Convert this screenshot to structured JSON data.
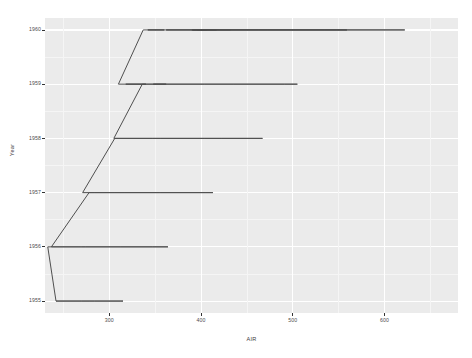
{
  "chart_data": {
    "type": "line",
    "title": "",
    "subtitle": "",
    "xlabel": "AIR",
    "ylabel": "Year",
    "xlim": [
      230,
      680
    ],
    "ylim": [
      1954.78,
      1960.22
    ],
    "grid": true,
    "legend": null,
    "x_ticks": [
      300,
      400,
      500,
      600
    ],
    "x_tick_labels": [
      "300",
      "400",
      "500",
      "600"
    ],
    "y_ticks": [
      1955,
      1956,
      1957,
      1958,
      1959,
      1960
    ],
    "y_tick_labels": [
      "1955",
      "1956",
      "1957",
      "1958",
      "1959",
      "1960"
    ],
    "series": [
      {
        "name": "AirPassengers",
        "color": "#4f4f4f",
        "x": [
          242,
          284,
          315,
          312,
          278,
          270,
          242,
          233,
          267,
          269,
          270,
          315,
          364,
          347,
          312,
          274,
          237,
          278,
          284,
          317,
          356,
          413,
          405,
          355,
          306,
          271,
          306,
          315,
          356,
          422,
          465,
          467,
          404,
          347,
          305,
          336,
          340,
          318,
          362,
          348,
          363,
          435,
          491,
          505,
          404,
          359,
          310,
          337,
          360,
          342,
          406,
          396,
          420,
          472,
          548,
          559,
          463,
          407,
          362,
          405,
          417,
          391,
          419,
          461,
          472,
          535,
          622,
          606,
          508,
          461,
          390,
          432
        ],
        "y": [
          1955.0,
          1955.0,
          1955.0,
          1955.0,
          1955.0,
          1955.0,
          1955.0,
          1956.0,
          1956.0,
          1956.0,
          1956.0,
          1956.0,
          1956.0,
          1956.0,
          1956.0,
          1956.0,
          1956.0,
          1957.0,
          1957.0,
          1957.0,
          1957.0,
          1957.0,
          1957.0,
          1957.0,
          1957.0,
          1957.0,
          1958.0,
          1958.0,
          1958.0,
          1958.0,
          1958.0,
          1958.0,
          1958.0,
          1958.0,
          1958.0,
          1959.0,
          1959.0,
          1959.0,
          1959.0,
          1959.0,
          1959.0,
          1959.0,
          1959.0,
          1959.0,
          1959.0,
          1959.0,
          1959.0,
          1960.0,
          1960.0,
          1960.0,
          1960.0,
          1960.0,
          1960.0,
          1960.0,
          1960.0,
          1960.0,
          1960.0,
          1960.0,
          1960.0,
          1960.0,
          1960.0,
          1960.0,
          1960.0,
          1960.0,
          1960.0,
          1960.0,
          1960.0,
          1960.0,
          1960.0,
          1960.0,
          1960.0,
          1960.0
        ]
      }
    ],
    "panel_background": "#ebebeb",
    "gridline_color": "#ffffff",
    "line_color": "#4f4f4f",
    "text_color": "#4d4d4d"
  }
}
